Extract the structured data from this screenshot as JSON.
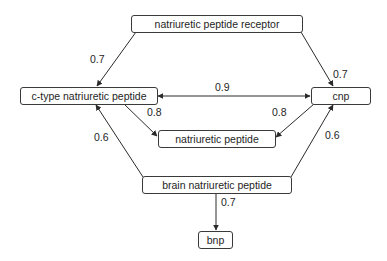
{
  "diagram": {
    "type": "directed-graph",
    "nodes": [
      {
        "id": "npr",
        "label": "natriuretic peptide receptor"
      },
      {
        "id": "ctnp",
        "label": "c-type natriuretic peptide"
      },
      {
        "id": "cnp",
        "label": "cnp"
      },
      {
        "id": "np",
        "label": "natriuretic peptide"
      },
      {
        "id": "bnpfull",
        "label": "brain natriuretic peptide"
      },
      {
        "id": "bnp",
        "label": "bnp"
      }
    ],
    "edges": [
      {
        "from": "natriuretic peptide receptor",
        "to": "c-type natriuretic peptide",
        "weight": "0.7"
      },
      {
        "from": "natriuretic peptide receptor",
        "to": "cnp",
        "weight": "0.7"
      },
      {
        "from": "c-type natriuretic peptide",
        "to": "cnp",
        "weight": "0.9",
        "bidirectional": true
      },
      {
        "from": "c-type natriuretic peptide",
        "to": "natriuretic peptide",
        "weight": "0.8"
      },
      {
        "from": "cnp",
        "to": "natriuretic peptide",
        "weight": "0.8"
      },
      {
        "from": "brain natriuretic peptide",
        "to": "c-type natriuretic peptide",
        "weight": "0.6"
      },
      {
        "from": "brain natriuretic peptide",
        "to": "cnp",
        "weight": "0.6"
      },
      {
        "from": "brain natriuretic peptide",
        "to": "bnp",
        "weight": "0.7"
      }
    ]
  },
  "colors": {
    "stroke": "#3a3a3a",
    "text": "#1e1e1e",
    "background": "#ffffff"
  }
}
